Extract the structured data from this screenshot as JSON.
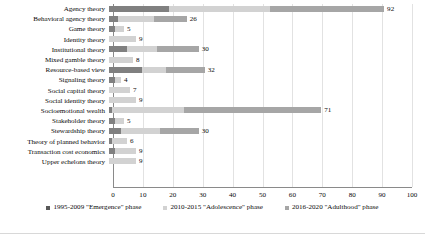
{
  "chart_data": {
    "type": "bar",
    "orientation": "horizontal",
    "stacked": true,
    "title": "",
    "subtitle": "",
    "xlabel": "",
    "ylabel": "",
    "xlim": [
      0,
      100
    ],
    "xticks": [
      0,
      10,
      20,
      30,
      40,
      50,
      60,
      70,
      80,
      90,
      100
    ],
    "grid": true,
    "legend_position": "bottom",
    "categories": [
      "Agency theory",
      "Behavioral agency theory",
      "Game theory",
      "Identity theory",
      "Institutional theory",
      "Mixed gamble theory",
      "Resource-based view",
      "Signaling theory",
      "Social capital theory",
      "Social identity theory",
      "Socioemotional wealth",
      "Stakeholder theory",
      "Stewardship theory",
      "Theory of planned behavior",
      "Transaction cost economics",
      "Upper echelons theory"
    ],
    "series": [
      {
        "name": "1995-2009 \"Emergence\" phase",
        "color": "#808080",
        "values": [
          20,
          3,
          2,
          0,
          6,
          0,
          11,
          2,
          0,
          0,
          1,
          2,
          4,
          1,
          2,
          0
        ]
      },
      {
        "name": "2010-2015 \"Adolescence\" phase",
        "color": "#d2d2d2",
        "values": [
          34,
          12,
          3,
          9,
          10,
          8,
          8,
          2,
          7,
          9,
          24,
          3,
          13,
          5,
          7,
          9
        ]
      },
      {
        "name": "2016-2020 \"Adulthood\" phase",
        "color": "#a6a6a6",
        "values": [
          38,
          11,
          0,
          0,
          14,
          0,
          13,
          0,
          0,
          0,
          46,
          0,
          13,
          0,
          0,
          0
        ]
      }
    ],
    "totals": [
      92,
      26,
      5,
      9,
      30,
      8,
      32,
      4,
      7,
      9,
      71,
      5,
      30,
      6,
      9,
      9
    ],
    "total_labels": [
      "92",
      "26",
      "5",
      "9",
      "30",
      "8",
      "32",
      "4",
      "7",
      "9",
      "71",
      "5",
      "30",
      "6",
      "9",
      "9"
    ]
  },
  "legend": {
    "items": [
      {
        "label": "1995-2009 \"Emergence\" phase",
        "color": "#595959"
      },
      {
        "label": "2010-2015 \"Adolescence\" phase",
        "color": "#d2d2d2"
      },
      {
        "label": "2016-2020 \"Adulthood\" phase",
        "color": "#a6a6a6"
      }
    ]
  }
}
